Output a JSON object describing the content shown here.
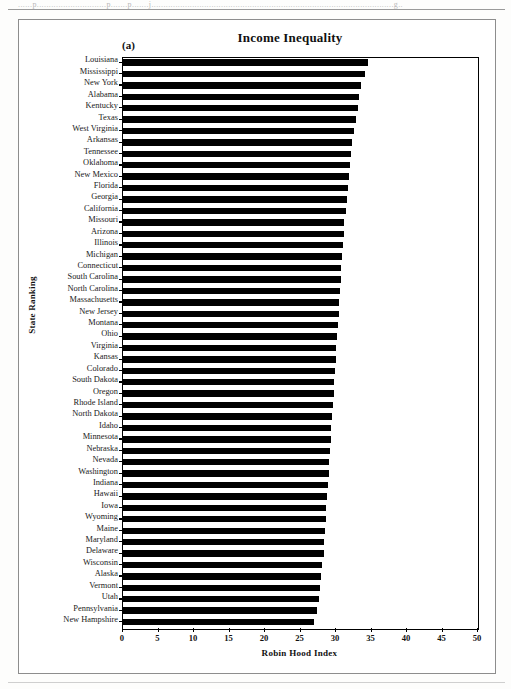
{
  "page": {
    "header_text": "......p.............................p.......p.......j.....................................................................................................g..",
    "panel_label": "(a)"
  },
  "chart_data": {
    "type": "bar",
    "orientation": "horizontal",
    "title": "Income Inequality",
    "xlabel": "Robin Hood Index",
    "ylabel": "State Ranking",
    "xlim": [
      0,
      50
    ],
    "xticks": [
      0,
      5,
      10,
      15,
      20,
      25,
      30,
      35,
      40,
      45,
      50
    ],
    "xtick_labels": [
      "0",
      "5",
      "10",
      "15",
      "20",
      "25",
      "30",
      "35",
      "40",
      "45",
      "50"
    ],
    "grid": false,
    "legend": "none",
    "bar_color": "#000000",
    "categories": [
      "Louisiana",
      "Mississippi",
      "New York",
      "Alabama",
      "Kentucky",
      "Texas",
      "West Virginia",
      "Arkansas",
      "Tennessee",
      "Oklahoma",
      "New Mexico",
      "Florida",
      "Georgia",
      "California",
      "Missouri",
      "Arizona",
      "Illinois",
      "Michigan",
      "Connecticut",
      "South Carolina",
      "North Carolina",
      "Massachusetts",
      "New Jersey",
      "Montana",
      "Ohio",
      "Virginia",
      "Kansas",
      "Colorado",
      "South Dakota",
      "Oregon",
      "Rhode Island",
      "North Dakota",
      "Idaho",
      "Minnesota",
      "Nebraska",
      "Nevada",
      "Washington",
      "Indiana",
      "Hawaii",
      "Iowa",
      "Wyoming",
      "Maine",
      "Maryland",
      "Delaware",
      "Wisconsin",
      "Alaska",
      "Vermont",
      "Utah",
      "Pennsylvania",
      "New Hampshire"
    ],
    "values": [
      34.6,
      34.2,
      33.6,
      33.4,
      33.2,
      32.9,
      32.7,
      32.4,
      32.3,
      32.1,
      32.0,
      31.8,
      31.7,
      31.5,
      31.3,
      31.2,
      31.1,
      31.0,
      30.9,
      30.8,
      30.7,
      30.6,
      30.5,
      30.4,
      30.3,
      30.2,
      30.1,
      30.0,
      29.9,
      29.8,
      29.7,
      29.6,
      29.5,
      29.4,
      29.3,
      29.2,
      29.1,
      29.0,
      28.9,
      28.8,
      28.7,
      28.6,
      28.5,
      28.4,
      28.2,
      28.0,
      27.9,
      27.7,
      27.4,
      27.1
    ]
  }
}
